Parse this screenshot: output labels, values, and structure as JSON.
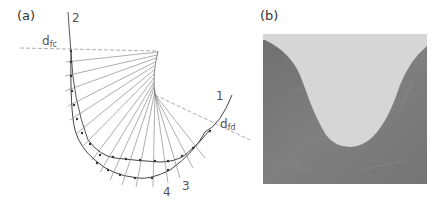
{
  "figure": {
    "panel_a": {
      "label": "(a)",
      "line_labels": {
        "l1": "1",
        "l2": "2",
        "l3": "3",
        "l4": "4"
      },
      "dim_labels": {
        "dfc_main": "d",
        "dfc_sub": "fc",
        "dfd_main": "d",
        "dfd_sub": "fd"
      }
    },
    "panel_b": {
      "label": "(b)",
      "photo_bg_color": "#7a7a7a",
      "photo_fill_color": "#d6d6d6"
    }
  }
}
